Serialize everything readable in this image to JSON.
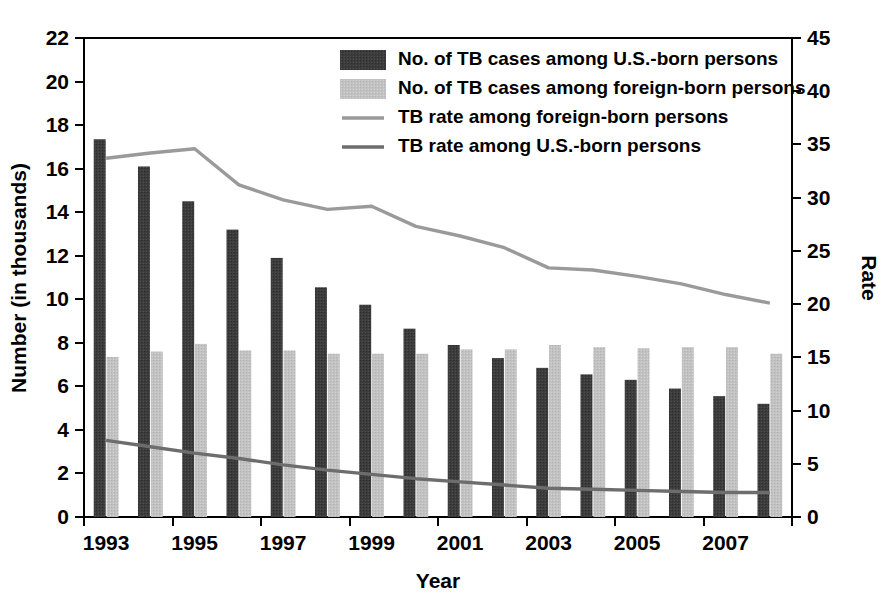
{
  "chart_data": {
    "type": "bar",
    "title": "",
    "subtitle": "",
    "xlabel": "Year",
    "ylabel": "Number (in thousands)",
    "y2label": "Rate",
    "grid": false,
    "legend_position": "top-center",
    "categories": [
      "1993",
      "1994",
      "1995",
      "1996",
      "1997",
      "1998",
      "1999",
      "2000",
      "2001",
      "2002",
      "2003",
      "2004",
      "2005",
      "2006",
      "2007",
      "2008"
    ],
    "xtick_labels": [
      "1993",
      "",
      "1995",
      "",
      "1997",
      "",
      "1999",
      "",
      "2001",
      "",
      "2003",
      "",
      "2005",
      "",
      "2007",
      ""
    ],
    "ylim": [
      0,
      22
    ],
    "yticks": [
      0,
      2,
      4,
      6,
      8,
      10,
      12,
      14,
      16,
      18,
      20,
      22
    ],
    "ytick_labels": [
      "0",
      "2",
      "4",
      "6",
      "8",
      "10",
      "12",
      "14",
      "16",
      "18",
      "20",
      "22"
    ],
    "y2lim": [
      0,
      45
    ],
    "y2ticks": [
      0,
      5,
      10,
      15,
      20,
      25,
      30,
      35,
      40,
      45
    ],
    "y2tick_labels": [
      "0",
      "5",
      "10",
      "15",
      "20",
      "25",
      "30",
      "35",
      "40",
      "45"
    ],
    "series": [
      {
        "name": "No. of TB cases among U.S.-born persons",
        "kind": "bar",
        "axis": "left",
        "color": "#3c3c3c",
        "values": [
          17.35,
          16.1,
          14.5,
          13.2,
          11.9,
          10.55,
          9.75,
          8.65,
          7.9,
          7.3,
          6.85,
          6.55,
          6.3,
          5.9,
          5.55,
          5.2
        ]
      },
      {
        "name": "No. of TB cases among foreign-born persons",
        "kind": "bar",
        "axis": "left",
        "color": "#c2c2c2",
        "values": [
          7.35,
          7.6,
          7.95,
          7.65,
          7.65,
          7.5,
          7.5,
          7.5,
          7.7,
          7.7,
          7.9,
          7.8,
          7.75,
          7.8,
          7.8,
          7.5
        ]
      },
      {
        "name": "TB rate among foreign-born persons",
        "kind": "line",
        "axis": "right",
        "color": "#9a9a9a",
        "values": [
          33.7,
          34.2,
          34.6,
          31.2,
          29.8,
          28.9,
          29.2,
          27.3,
          26.4,
          25.3,
          23.4,
          23.2,
          22.6,
          21.9,
          20.9,
          20.1
        ]
      },
      {
        "name": "TB rate among U.S.-born persons",
        "kind": "line",
        "axis": "right",
        "color": "#6d6d6d",
        "values": [
          7.2,
          6.6,
          6.0,
          5.5,
          4.9,
          4.4,
          4.0,
          3.6,
          3.3,
          3.0,
          2.7,
          2.6,
          2.5,
          2.4,
          2.3,
          2.3
        ]
      }
    ],
    "legend_entries": [
      {
        "label": "No. of TB cases among U.S.-born persons",
        "marker": "swatch",
        "color": "#3c3c3c"
      },
      {
        "label": "No. of TB cases among foreign-born persons",
        "marker": "swatch",
        "color": "#c2c2c2"
      },
      {
        "label": "TB rate among foreign-born persons",
        "marker": "line",
        "color": "#9a9a9a"
      },
      {
        "label": "TB rate among U.S.-born persons",
        "marker": "line",
        "color": "#6d6d6d"
      }
    ]
  }
}
